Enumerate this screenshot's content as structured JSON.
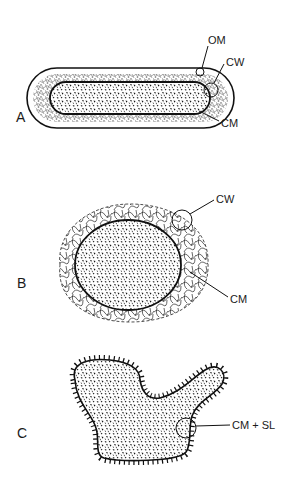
{
  "panels": [
    {
      "id": "A",
      "label": "A",
      "shape": "rod",
      "annotations": [
        "OM",
        "CW",
        "CM"
      ]
    },
    {
      "id": "B",
      "label": "B",
      "shape": "coccus",
      "annotations": [
        "CW",
        "CM"
      ]
    },
    {
      "id": "C",
      "label": "C",
      "shape": "irregular",
      "annotations": [
        "CM + SL"
      ]
    }
  ],
  "colors": {
    "ink": "#1a1a1a",
    "background": "#ffffff"
  }
}
